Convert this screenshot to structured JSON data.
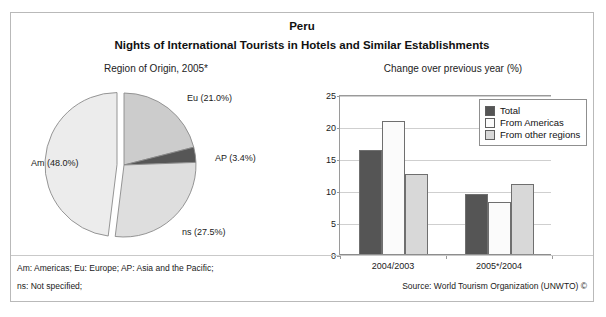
{
  "header": {
    "country": "Peru",
    "subtitle": "Nights of International Tourists in Hotels and Similar Establishments"
  },
  "pie_caption": "Region of Origin, 2005*",
  "bar_caption": "Change over previous year (%)",
  "footer": {
    "note_line1": "Am: Americas; Eu: Europe; AP: Asia and the Pacific;",
    "note_line2": "ns: Not specified;",
    "source": "Source: World Tourism Organization (UNWTO) ©"
  },
  "colors": {
    "slice_am": "#ececec",
    "slice_eu": "#cccccc",
    "slice_ap": "#565656",
    "slice_ns": "#dedede",
    "bar_total": "#555555",
    "bar_americas": "#fbfbfb",
    "bar_other": "#d8d8d8",
    "grid": "#cfcfcf",
    "axis": "#8d8d8d"
  },
  "chart_data": [
    {
      "type": "pie",
      "title": "Region of Origin, 2005*",
      "labels": [
        "Eu",
        "AP",
        "ns",
        "Am"
      ],
      "label_texts": [
        "Eu (21.0%)",
        "AP (3.4%)",
        "ns (27.5%)",
        "Am (48.0%)"
      ],
      "values": [
        21.0,
        3.4,
        27.5,
        48.0
      ],
      "unit": "%",
      "exploded": [
        "Am"
      ],
      "legend": "none"
    },
    {
      "type": "bar",
      "title": "Change over previous year (%)",
      "categories": [
        "2004/2003",
        "2005*/2004"
      ],
      "series": [
        {
          "name": "Total",
          "values": [
            16.4,
            9.6
          ]
        },
        {
          "name": "From Americas",
          "values": [
            21.0,
            8.3
          ]
        },
        {
          "name": "From other regions",
          "values": [
            12.7,
            11.1
          ]
        }
      ],
      "xlabel": "",
      "ylabel": "",
      "ylim": [
        0,
        25
      ],
      "yticks": [
        0,
        5,
        10,
        15,
        20,
        25
      ],
      "ytick_labels": [
        "0",
        "5",
        "10",
        "15",
        "20",
        "25"
      ],
      "grid": true,
      "legend_position": "top-right"
    }
  ]
}
